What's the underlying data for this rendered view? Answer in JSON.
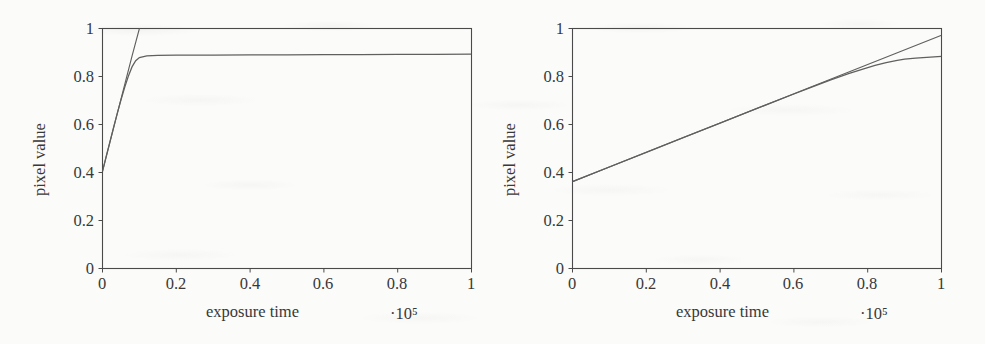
{
  "figure": {
    "background_color": "#fbfbf9",
    "line_color": "#555555",
    "axis_color": "#4a4a4a",
    "text_color": "#38383a"
  },
  "chart_data": [
    {
      "type": "line",
      "panel": "left",
      "title": "",
      "xlabel": "exposure time",
      "ylabel": "pixel value",
      "x_exponent_label": "·10⁵",
      "xlim": [
        0,
        1
      ],
      "ylim": [
        0,
        1
      ],
      "grid": false,
      "legend": "none",
      "xticks": [
        "0",
        "0.2",
        "0.4",
        "0.6",
        "0.8",
        "1"
      ],
      "xtick_values": [
        0,
        0.2,
        0.4,
        0.6,
        0.8,
        1
      ],
      "yticks": [
        "0",
        "0.2",
        "0.4",
        "0.6",
        "0.8",
        "1"
      ],
      "ytick_values": [
        0,
        0.2,
        0.4,
        0.6,
        0.8,
        1
      ],
      "series": [
        {
          "name": "linear response",
          "style": "solid",
          "clipped_at_top": true,
          "x": [
            0,
            0.02,
            0.04,
            0.06,
            0.08,
            0.1,
            0.102
          ],
          "y": [
            0.405,
            0.525,
            0.645,
            0.765,
            0.885,
            1.0,
            1.0
          ]
        },
        {
          "name": "saturating response",
          "style": "solid",
          "x": [
            0,
            0.01,
            0.02,
            0.03,
            0.04,
            0.05,
            0.06,
            0.07,
            0.08,
            0.09,
            0.1,
            0.12,
            0.15,
            0.2,
            0.3,
            0.4,
            0.5,
            0.6,
            0.7,
            0.8,
            0.9,
            1.0
          ],
          "y": [
            0.405,
            0.467,
            0.528,
            0.588,
            0.646,
            0.702,
            0.754,
            0.801,
            0.84,
            0.866,
            0.879,
            0.886,
            0.888,
            0.889,
            0.889,
            0.89,
            0.89,
            0.891,
            0.891,
            0.892,
            0.892,
            0.893
          ]
        }
      ]
    },
    {
      "type": "line",
      "panel": "right",
      "title": "",
      "xlabel": "exposure time",
      "ylabel": "pixel value",
      "x_exponent_label": "·10⁵",
      "xlim": [
        0,
        1
      ],
      "ylim": [
        0,
        1
      ],
      "grid": false,
      "legend": "none",
      "xticks": [
        "0",
        "0.2",
        "0.4",
        "0.6",
        "0.8",
        "1"
      ],
      "xtick_values": [
        0,
        0.2,
        0.4,
        0.6,
        0.8,
        1
      ],
      "yticks": [
        "0",
        "0.2",
        "0.4",
        "0.6",
        "0.8",
        "1"
      ],
      "ytick_values": [
        0,
        0.2,
        0.4,
        0.6,
        0.8,
        1
      ],
      "series": [
        {
          "name": "linear response",
          "style": "solid",
          "x": [
            0,
            0.2,
            0.4,
            0.6,
            0.8,
            1.0
          ],
          "y": [
            0.362,
            0.484,
            0.606,
            0.728,
            0.85,
            0.972
          ]
        },
        {
          "name": "saturating response",
          "style": "solid",
          "x": [
            0,
            0.1,
            0.2,
            0.3,
            0.4,
            0.5,
            0.6,
            0.65,
            0.7,
            0.75,
            0.8,
            0.82,
            0.85,
            0.88,
            0.9,
            0.93,
            0.95,
            0.97,
            1.0
          ],
          "y": [
            0.362,
            0.423,
            0.484,
            0.545,
            0.606,
            0.667,
            0.727,
            0.757,
            0.786,
            0.813,
            0.837,
            0.846,
            0.858,
            0.867,
            0.872,
            0.877,
            0.879,
            0.881,
            0.884
          ]
        }
      ]
    }
  ]
}
